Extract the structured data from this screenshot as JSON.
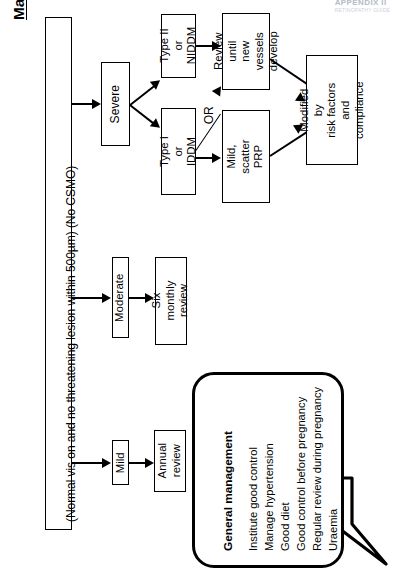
{
  "page": {
    "title": "Management of non-proliferative retinopathy",
    "header_mark": "APPENDIX II",
    "header_sub": "RETINOPATHY GUIDE"
  },
  "stem": {
    "criteria": "(Normal vis on and no threatening lesion within 500µm) (No CSMO)"
  },
  "branches": {
    "severe": {
      "label": "Severe"
    },
    "moderate": {
      "label": "Moderate",
      "outcome": "Six monthly\nreview"
    },
    "mild": {
      "label": "Mild",
      "outcome": "Annual\nreview"
    }
  },
  "severe_path": {
    "type2": "Type II\nor NIDDM",
    "type1": "Type I\nor IDDM",
    "review": "Review until\nnew vessels\ndevelop",
    "prp": "Mild,\nscatter PRP",
    "or_label": "OR",
    "modified": "Modified by\nrisk factors and\ncompliance"
  },
  "callout": {
    "heading": "General management",
    "items": [
      "Institute good control",
      "Manage hypertension",
      "Good diet",
      "Good control before pregnancy",
      "Regular review during pregnancy",
      "Uraemia"
    ]
  },
  "colors": {
    "ink": "#000000",
    "paper": "#ffffff",
    "header_mark": "#a9b0bd"
  }
}
